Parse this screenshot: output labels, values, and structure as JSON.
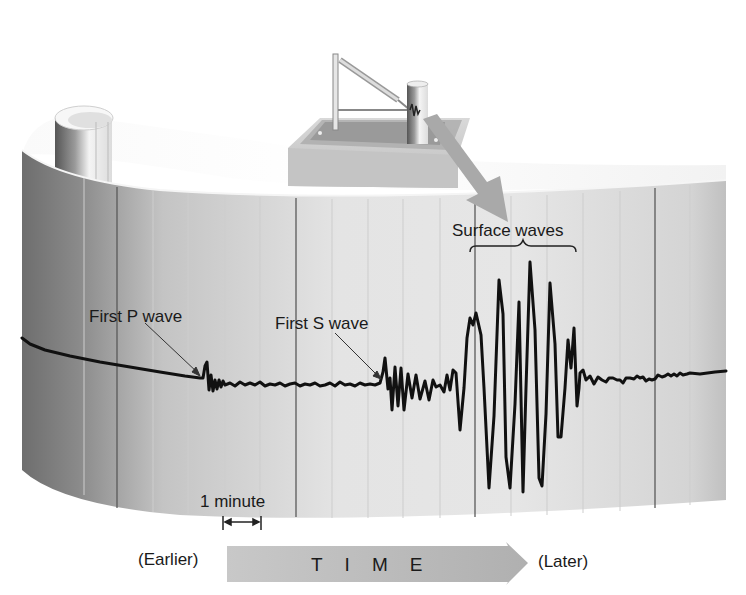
{
  "diagram": {
    "labels": {
      "first_p_wave": "First P wave",
      "first_s_wave": "First S wave",
      "surface_waves": "Surface waves",
      "one_minute": "1 minute",
      "earlier": "(Earlier)",
      "later": "(Later)",
      "time": "TIME"
    },
    "components": {
      "seismograph": "seismograph-instrument",
      "drum": "recording-drum-paper",
      "direction_arrow": "arrow-instrument-to-drum",
      "time_arrow": "time-arrow-right"
    },
    "colors": {
      "trace": "#111111",
      "drum_light": "#e8e8e8",
      "drum_dark": "#7a7a7a",
      "gridline_major": "#555555",
      "gridline_minor": "#c8c8c8",
      "arrow_fill": "#a9a9a9",
      "text": "#1a1a1a"
    },
    "gridlines": {
      "major_x": [
        117,
        296,
        475,
        655
      ],
      "minor_x": [
        84,
        153,
        188,
        225,
        260,
        332,
        368,
        403,
        440,
        511,
        547,
        583,
        620,
        690
      ]
    },
    "phases": [
      {
        "name": "P wave arrival",
        "x": 204
      },
      {
        "name": "S wave arrival",
        "x": 383
      },
      {
        "name": "Surface waves",
        "x_start": 470,
        "x_end": 577
      }
    ]
  }
}
